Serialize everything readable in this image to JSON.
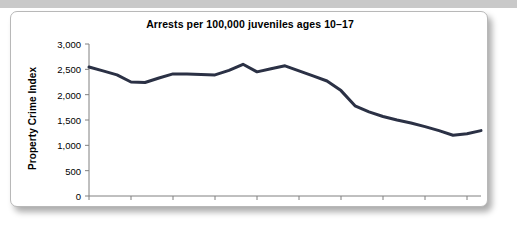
{
  "chart_data": {
    "type": "line",
    "title": "Arrests per 100,000 juveniles ages 10–17",
    "xlabel": "",
    "ylabel": "Property Crime Index",
    "xlim": [
      1980,
      2008
    ],
    "ylim": [
      0,
      3000
    ],
    "grid": false,
    "legend": null,
    "y_ticks": [
      0,
      500,
      1000,
      1500,
      2000,
      2500,
      3000
    ],
    "y_tick_labels": [
      "0",
      "500",
      "1,000",
      "1,500",
      "2,000",
      "2,500",
      "3,000"
    ],
    "x_ticks": [
      1980,
      1983,
      1986,
      1989,
      1992,
      1995,
      1998,
      2001,
      2004,
      2007
    ],
    "x_tick_labels": [
      "1980",
      "1983",
      "1986",
      "1989",
      "1992",
      "1995",
      "1998",
      "2001",
      "2004",
      "2007"
    ],
    "x": [
      1980,
      1981,
      1982,
      1983,
      1984,
      1985,
      1986,
      1987,
      1988,
      1989,
      1990,
      1991,
      1992,
      1993,
      1994,
      1995,
      1996,
      1997,
      1998,
      1999,
      2000,
      2001,
      2002,
      2003,
      2004,
      2005,
      2006,
      2007,
      2008
    ],
    "values": [
      2545,
      2470,
      2390,
      2250,
      2240,
      2330,
      2410,
      2410,
      2400,
      2390,
      2480,
      2600,
      2450,
      2510,
      2570,
      2470,
      2370,
      2270,
      2080,
      1780,
      1660,
      1570,
      1500,
      1440,
      1370,
      1290,
      1200,
      1230,
      1290
    ],
    "series_name": "Property Crime Index arrest rate",
    "line_color": "#2b3145",
    "line_width": 3
  },
  "frame": {
    "border_color": "#b8b8b8",
    "background": "#ffffff",
    "top_band_color": "#c9c9c9"
  },
  "axis": {
    "color": "#808080"
  }
}
